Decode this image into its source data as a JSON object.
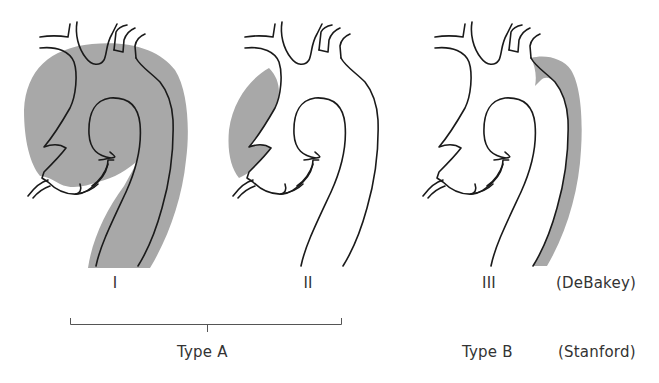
{
  "diagram": {
    "colors": {
      "dissection_fill": "#a8a8a8",
      "outline": "#1a1a1a",
      "text": "#333333"
    },
    "figures": [
      {
        "id": "I",
        "label": "I",
        "dissection_extent": "ascending + arch + descending"
      },
      {
        "id": "II",
        "label": "II",
        "dissection_extent": "ascending only"
      },
      {
        "id": "III",
        "label": "III",
        "dissection_extent": "descending only"
      }
    ],
    "debakey_label": "(DeBakey)",
    "stanford_label": "(Stanford)",
    "stanford_types": [
      {
        "label": "Type A",
        "spans": [
          "I",
          "II"
        ]
      },
      {
        "label": "Type B",
        "spans": [
          "III"
        ]
      }
    ]
  }
}
